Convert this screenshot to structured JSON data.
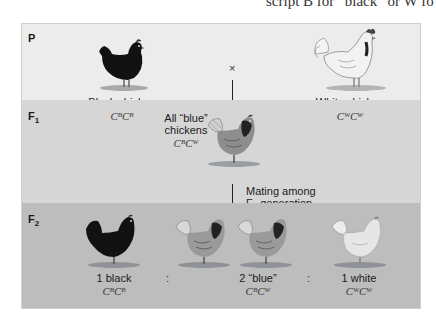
{
  "top_text": "script B for “black” or W fo",
  "generations": {
    "p": {
      "label": "P",
      "cross_symbol": "×",
      "left": {
        "name": "Black chicken",
        "allele1": "B",
        "allele2": "B"
      },
      "right": {
        "name": "White chicken",
        "allele1": "W",
        "allele2": "W"
      }
    },
    "f1": {
      "label": "F",
      "label_sub": "1",
      "desc_line1": "All “blue”",
      "desc_line2": "chickens",
      "allele1": "B",
      "allele2": "W",
      "mating_line1": "Mating among",
      "mating_line2_pre": "F",
      "mating_line2_sub": "1",
      "mating_line2_post": " generation"
    },
    "f2": {
      "label": "F",
      "label_sub": "2",
      "separator": ":",
      "groups": [
        {
          "name": "1 black",
          "allele1": "B",
          "allele2": "B"
        },
        {
          "name": "2 “blue”",
          "allele1": "B",
          "allele2": "W"
        },
        {
          "name": "1 white",
          "allele1": "W",
          "allele2": "W"
        }
      ]
    }
  },
  "gene_letter": "C",
  "colors": {
    "panel_p": "#ececec",
    "panel_f1": "#d6d6d6",
    "panel_f2": "#bdbdbd"
  }
}
